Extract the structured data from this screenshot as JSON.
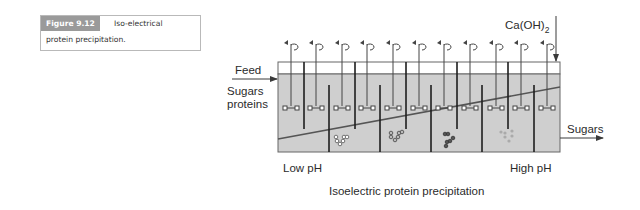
{
  "caption": {
    "figure_label": "Figure 9.12",
    "text_line1": "Iso-electrical",
    "text_line2": "protein precipitation."
  },
  "diagram": {
    "title": "Isoelectric protein precipitation",
    "inputs": {
      "feed_label": "Feed",
      "feed_content_line1": "Sugars",
      "feed_content_line2": "proteins",
      "reagent_label": "Ca(OH)",
      "reagent_subscript": "2"
    },
    "outputs": {
      "product_label": "Sugars"
    },
    "axis": {
      "left_label": "Low pH",
      "right_label": "High pH"
    },
    "tank": {
      "agitator_count": 11,
      "baffle_count": 10,
      "precipitate_groups": 4
    },
    "colors": {
      "liquid": "#cfcfcf",
      "outline": "#555555",
      "baffle": "#1e1e1e",
      "ph_gradient_line": "#555555"
    }
  }
}
